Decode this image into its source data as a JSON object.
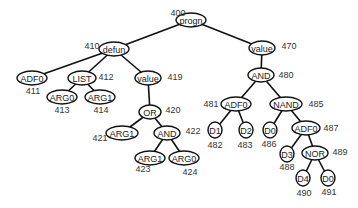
{
  "diagram": {
    "type": "parse-tree",
    "nodes": [
      {
        "id": "400",
        "label": "progn",
        "x": 191,
        "y": 20,
        "rx": 15,
        "ry": 7,
        "id_x": 178,
        "id_y": 13
      },
      {
        "id": "410",
        "label": "defun",
        "x": 114,
        "y": 49,
        "rx": 15,
        "ry": 7,
        "id_x": 92,
        "id_y": 46
      },
      {
        "id": "470",
        "label": "value",
        "x": 262,
        "y": 48,
        "rx": 13,
        "ry": 7,
        "id_x": 289,
        "id_y": 46
      },
      {
        "id": "411",
        "label": "ADF0",
        "x": 32,
        "y": 78,
        "rx": 15,
        "ry": 7,
        "id_x": 33,
        "id_y": 91
      },
      {
        "id": "412",
        "label": "LIST",
        "x": 82,
        "y": 78,
        "rx": 14,
        "ry": 7,
        "id_x": 106,
        "id_y": 77
      },
      {
        "id": "419",
        "label": "value",
        "x": 148,
        "y": 78,
        "rx": 13,
        "ry": 7,
        "id_x": 175,
        "id_y": 77
      },
      {
        "id": "413",
        "label": "ARG0",
        "x": 62,
        "y": 97,
        "rx": 15,
        "ry": 7,
        "id_x": 62,
        "id_y": 110
      },
      {
        "id": "414",
        "label": "ARG1",
        "x": 100,
        "y": 97,
        "rx": 15,
        "ry": 7,
        "id_x": 101,
        "id_y": 110
      },
      {
        "id": "480",
        "label": "AND",
        "x": 261,
        "y": 75,
        "rx": 13,
        "ry": 7,
        "id_x": 286,
        "id_y": 75
      },
      {
        "id": "420",
        "label": "OR",
        "x": 150,
        "y": 112,
        "rx": 11,
        "ry": 7,
        "id_x": 173,
        "id_y": 110
      },
      {
        "id": "421",
        "label": "ARG1",
        "x": 122,
        "y": 133,
        "rx": 16,
        "ry": 7,
        "id_x": 100,
        "id_y": 138
      },
      {
        "id": "422",
        "label": "AND",
        "x": 167,
        "y": 133,
        "rx": 13,
        "ry": 7,
        "id_x": 193,
        "id_y": 131
      },
      {
        "id": "423",
        "label": "ARG1",
        "x": 150,
        "y": 158,
        "rx": 15,
        "ry": 7,
        "id_x": 143,
        "id_y": 169
      },
      {
        "id": "424",
        "label": "ARG0",
        "x": 184,
        "y": 158,
        "rx": 15,
        "ry": 7,
        "id_x": 190,
        "id_y": 172
      },
      {
        "id": "481",
        "label": "ADF0",
        "x": 236,
        "y": 104,
        "rx": 15,
        "ry": 7,
        "id_x": 211,
        "id_y": 104
      },
      {
        "id": "485",
        "label": "NAND",
        "x": 286,
        "y": 104,
        "rx": 16,
        "ry": 7,
        "id_x": 316,
        "id_y": 104
      },
      {
        "id": "482",
        "label": "D1",
        "x": 215,
        "y": 130,
        "rx": 7,
        "ry": 8,
        "id_x": 215,
        "id_y": 145
      },
      {
        "id": "483",
        "label": "D2",
        "x": 246,
        "y": 130,
        "rx": 7,
        "ry": 8,
        "id_x": 245,
        "id_y": 145
      },
      {
        "id": "486",
        "label": "D0",
        "x": 270,
        "y": 130,
        "rx": 7,
        "ry": 8,
        "id_x": 269,
        "id_y": 144
      },
      {
        "id": "487",
        "label": "ADF0",
        "x": 306,
        "y": 128,
        "rx": 14,
        "ry": 7,
        "id_x": 331,
        "id_y": 128
      },
      {
        "id": "488",
        "label": "D3",
        "x": 287,
        "y": 154,
        "rx": 7,
        "ry": 8,
        "id_x": 287,
        "id_y": 167
      },
      {
        "id": "489",
        "label": "NOR",
        "x": 315,
        "y": 153,
        "rx": 13,
        "ry": 7,
        "id_x": 340,
        "id_y": 152
      },
      {
        "id": "490",
        "label": "D4",
        "x": 303,
        "y": 178,
        "rx": 7,
        "ry": 8,
        "id_x": 304,
        "id_y": 193
      },
      {
        "id": "491",
        "label": "D0",
        "x": 328,
        "y": 178,
        "rx": 7,
        "ry": 8,
        "id_x": 329,
        "id_y": 192
      }
    ],
    "edges": [
      [
        "400",
        "410"
      ],
      [
        "400",
        "470"
      ],
      [
        "410",
        "411"
      ],
      [
        "410",
        "412"
      ],
      [
        "410",
        "419"
      ],
      [
        "412",
        "413"
      ],
      [
        "412",
        "414"
      ],
      [
        "419",
        "420"
      ],
      [
        "420",
        "421"
      ],
      [
        "420",
        "422"
      ],
      [
        "422",
        "423"
      ],
      [
        "422",
        "424"
      ],
      [
        "470",
        "480"
      ],
      [
        "480",
        "481"
      ],
      [
        "480",
        "485"
      ],
      [
        "481",
        "482"
      ],
      [
        "481",
        "483"
      ],
      [
        "485",
        "486"
      ],
      [
        "485",
        "487"
      ],
      [
        "487",
        "488"
      ],
      [
        "487",
        "489"
      ],
      [
        "489",
        "490"
      ],
      [
        "489",
        "491"
      ]
    ]
  }
}
